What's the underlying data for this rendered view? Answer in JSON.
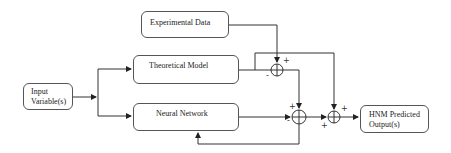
{
  "diagram": {
    "type": "block-diagram",
    "title": "",
    "nodes": {
      "experimental_data": {
        "label": "Experimental Data"
      },
      "theoretical_model": {
        "label": "Theoretical Model"
      },
      "neural_network": {
        "label": "Neural Network"
      },
      "input": {
        "label_line1": "Input",
        "label_line2": "Variable(s)"
      },
      "output": {
        "label_line1": "HNM Predicted",
        "label_line2": "Output(s)"
      }
    },
    "summing_junctions": [
      {
        "id": "sum1",
        "signs": {
          "top_right": "+",
          "left": "-"
        }
      },
      {
        "id": "sum2",
        "signs": {
          "top_left": "+",
          "left": "-"
        }
      },
      {
        "id": "sum3",
        "signs": {
          "top_right": "+",
          "bottom_left": "+"
        }
      }
    ],
    "edges": [
      {
        "from": "input",
        "to": "theoretical_model"
      },
      {
        "from": "input",
        "to": "neural_network"
      },
      {
        "from": "experimental_data",
        "to": "sum1",
        "sign": "+"
      },
      {
        "from": "theoretical_model",
        "to": "sum1",
        "sign": "-"
      },
      {
        "from": "theoretical_model",
        "to": "sum3",
        "sign": "+"
      },
      {
        "from": "sum1",
        "to": "sum2",
        "sign": "+"
      },
      {
        "from": "neural_network",
        "to": "sum2",
        "sign": "-"
      },
      {
        "from": "sum2",
        "to": "neural_network",
        "note": "feedback"
      },
      {
        "from": "neural_network",
        "to": "sum3",
        "sign": "+"
      },
      {
        "from": "sum3",
        "to": "output"
      }
    ],
    "colors": {
      "line": "#333333",
      "border": "#555555",
      "background": "#ffffff"
    }
  }
}
